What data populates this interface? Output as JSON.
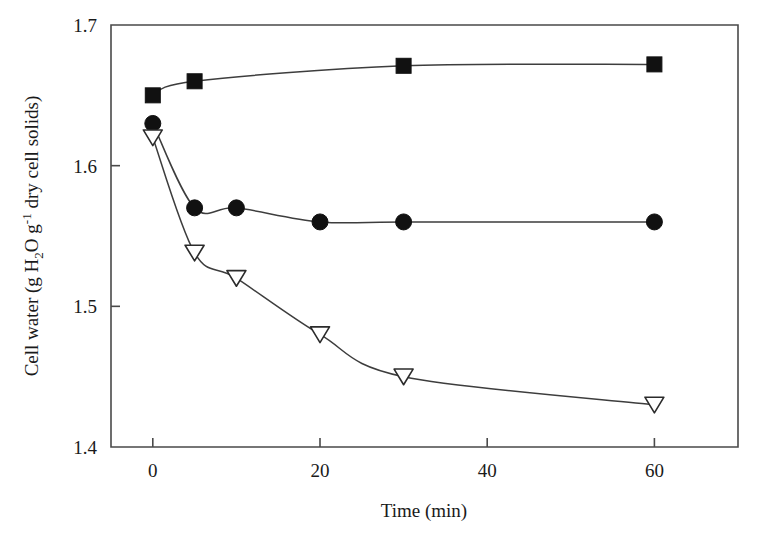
{
  "chart_data": {
    "type": "line",
    "title": "",
    "xlabel": "Time (min)",
    "ylabel": "Cell water (g H2O g-1 dry cell solids)",
    "ylabel_parts": {
      "prefix": "Cell water (g H",
      "sub_2": "2",
      "mid": "O g",
      "sup_minus1": "-1",
      "suffix": " dry cell solids)"
    },
    "xlim": [
      -5,
      70
    ],
    "ylim": [
      1.4,
      1.7
    ],
    "xticks": [
      0,
      20,
      40,
      60
    ],
    "xtick_labels": [
      "0",
      "20",
      "40",
      "60"
    ],
    "yticks": [
      1.4,
      1.5,
      1.6,
      1.7
    ],
    "ytick_labels": [
      "1.4",
      "1.5",
      "1.6",
      "1.7"
    ],
    "grid": false,
    "legend": "none",
    "series": [
      {
        "name": "filled-square-series",
        "marker": "filled-square",
        "x": [
          0,
          5,
          30,
          60
        ],
        "values": [
          1.65,
          1.66,
          1.671,
          1.672
        ]
      },
      {
        "name": "filled-circle-series",
        "marker": "filled-circle",
        "x": [
          0,
          5,
          10,
          20,
          30,
          60
        ],
        "values": [
          1.63,
          1.57,
          1.57,
          1.56,
          1.56,
          1.56
        ]
      },
      {
        "name": "open-triangle-series",
        "marker": "open-triangle-down",
        "x": [
          0,
          5,
          10,
          20,
          30,
          60
        ],
        "values": [
          1.62,
          1.538,
          1.52,
          1.48,
          1.45,
          1.43
        ]
      }
    ],
    "colors": {
      "marker_filled": "#111111",
      "marker_open_fill": "#ffffff",
      "line": "#3d3d3d",
      "axis": "#4a4a4a",
      "background": "#ffffff"
    }
  }
}
